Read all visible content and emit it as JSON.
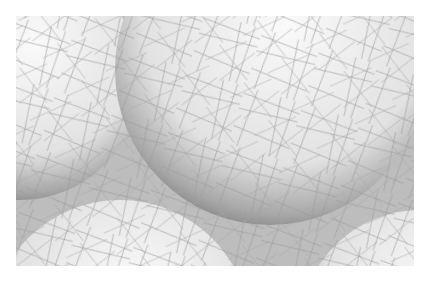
{
  "image": {
    "description": "Grayscale artwork of overlapping spheres wrapped in a dense web of thin crisscrossing lines",
    "palette": {
      "background": "#ffffff",
      "sphere_light": "#f4f4f4",
      "sphere_shadow": "#8a8a8a",
      "gap_fill": "#b8b8b8",
      "line": "#9a9a9a"
    },
    "spheres": [
      {
        "name": "top-left",
        "cx": 20,
        "cy": 80,
        "r": 120
      },
      {
        "name": "center-large",
        "cx": 270,
        "cy": 70,
        "r": 155
      },
      {
        "name": "bottom-left",
        "cx": 120,
        "cy": 330,
        "r": 130
      },
      {
        "name": "bottom-right",
        "cx": 420,
        "cy": 330,
        "r": 120
      }
    ]
  }
}
